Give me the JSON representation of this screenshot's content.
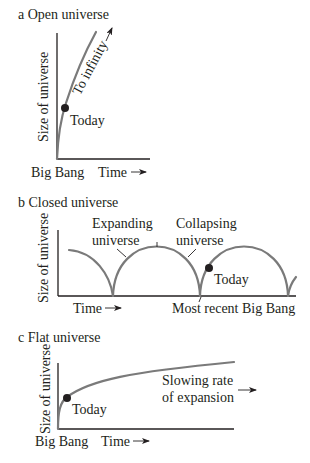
{
  "panels": [
    {
      "id": "a",
      "title": "a  Open universe",
      "ylabel": "Size of universe",
      "x_start_label": "Big Bang",
      "x_label": "Time",
      "annotations": {
        "today": "Today",
        "curve": "To infinity"
      }
    },
    {
      "id": "b",
      "title": "b  Closed universe",
      "ylabel": "Size of universe",
      "x_label": "Time",
      "annotations": {
        "expanding_1": "Expanding",
        "expanding_2": "universe",
        "collapsing_1": "Collapsing",
        "collapsing_2": "universe",
        "today": "Today",
        "recent_bang": "Most recent Big Bang"
      }
    },
    {
      "id": "c",
      "title": "c  Flat universe",
      "ylabel": "Size of universe",
      "x_start_label": "Big Bang",
      "x_label": "Time",
      "annotations": {
        "today": "Today",
        "slowing_1": "Slowing rate",
        "slowing_2": "of expansion"
      }
    }
  ],
  "colors": {
    "curve": "#7a7a7a",
    "ink": "#231f20"
  }
}
